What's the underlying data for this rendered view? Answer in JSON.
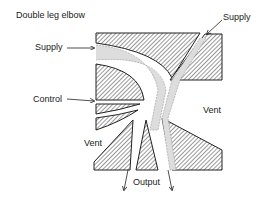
{
  "title": "Double leg elbow",
  "labels": {
    "supply_left": "Supply",
    "supply_right": "Supply",
    "control": "Control",
    "vent_left": "Vent",
    "vent_right": "Vent",
    "output": "Output"
  },
  "colors": {
    "ink": "#222222",
    "background": "#ffffff"
  }
}
